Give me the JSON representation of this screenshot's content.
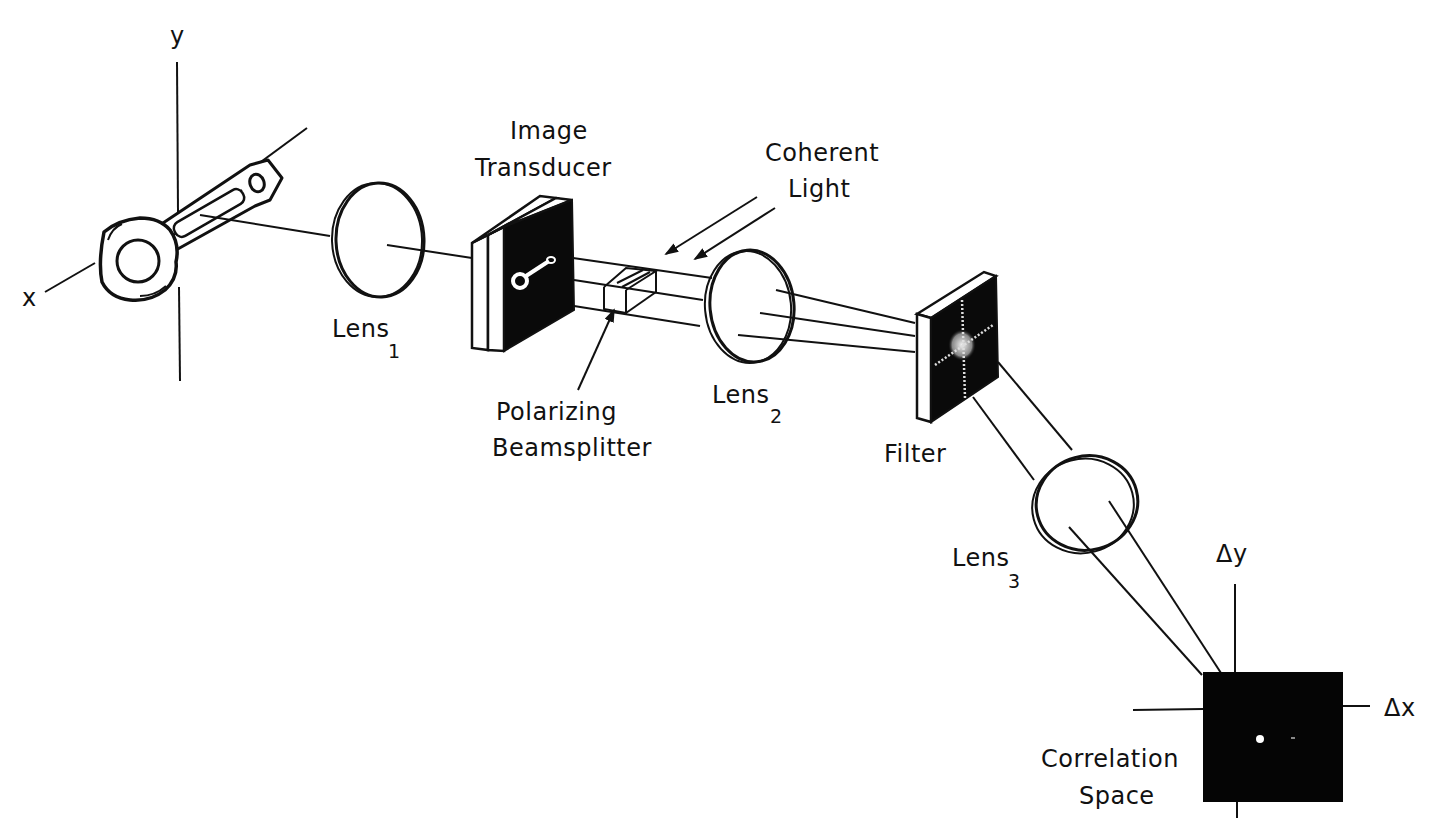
{
  "diagram": {
    "type": "optical correlator schematic",
    "colors": {
      "ink": "#111111",
      "background": "#ffffff"
    },
    "axes": {
      "object_x_label": "x",
      "object_y_label": "y",
      "correlation_x_label": "Δx",
      "correlation_y_label": "Δy"
    },
    "labels": {
      "lens1": {
        "text": "Lens",
        "sub": "1"
      },
      "lens2": {
        "text": "Lens",
        "sub": "2"
      },
      "lens3": {
        "text": "Lens",
        "sub": "3"
      },
      "transducer_line1": "Image",
      "transducer_line2": "Transducer",
      "light_line1": "Coherent",
      "light_line2": "Light",
      "splitter_line1": "Polarizing",
      "splitter_line2": "Beamsplitter",
      "filter": "Filter",
      "correlation_line1": "Correlation",
      "correlation_line2": "Space"
    },
    "components": [
      "Object (connecting rod)",
      "Lens 1",
      "Image Transducer",
      "Polarizing Beamsplitter",
      "Coherent Light",
      "Lens 2",
      "Filter",
      "Lens 3",
      "Correlation Space"
    ]
  }
}
